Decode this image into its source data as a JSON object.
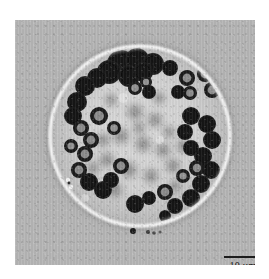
{
  "figure": {
    "kind": "light-micrograph",
    "caption_alt": "Spherical algal cell with dark chloroplast granules",
    "panel": {
      "background_color": "#b6b6b6",
      "interior_color": "#d2d2d2",
      "wall_highlight_color": "#fbfbfb",
      "granule_color": "#131313"
    }
  },
  "scalebar": {
    "label": "10 µm",
    "value": "10",
    "unit": "µm",
    "bar_color": "#1d1d1d",
    "bar_length_px": "38"
  },
  "specimen": {
    "center_x": 125,
    "center_y": 116,
    "radius": 91,
    "wall_thickness": 4,
    "sharp_granules": [
      {
        "cx": 106,
        "cy": 44,
        "r": 14,
        "type": "dark-mass"
      },
      {
        "cx": 122,
        "cy": 40,
        "r": 12,
        "type": "dark-mass"
      },
      {
        "cx": 138,
        "cy": 44,
        "r": 11,
        "type": "dark-mass"
      },
      {
        "cx": 94,
        "cy": 52,
        "r": 12,
        "type": "dark-mass"
      },
      {
        "cx": 114,
        "cy": 56,
        "r": 11,
        "type": "dark-mass"
      },
      {
        "cx": 155,
        "cy": 48,
        "r": 8,
        "type": "dark"
      },
      {
        "cx": 172,
        "cy": 58,
        "r": 8,
        "type": "ringed"
      },
      {
        "cx": 190,
        "cy": 54,
        "r": 8,
        "type": "ringed"
      },
      {
        "cx": 197,
        "cy": 70,
        "r": 8,
        "type": "ringed"
      },
      {
        "cx": 175,
        "cy": 73,
        "r": 7,
        "type": "ringed"
      },
      {
        "cx": 120,
        "cy": 68,
        "r": 7,
        "type": "ringed"
      },
      {
        "cx": 131,
        "cy": 62,
        "r": 6,
        "type": "ringed"
      },
      {
        "cx": 70,
        "cy": 66,
        "r": 10,
        "type": "dark"
      },
      {
        "cx": 62,
        "cy": 82,
        "r": 10,
        "type": "dark"
      },
      {
        "cx": 58,
        "cy": 96,
        "r": 9,
        "type": "dark"
      },
      {
        "cx": 66,
        "cy": 108,
        "r": 8,
        "type": "ringed"
      },
      {
        "cx": 76,
        "cy": 120,
        "r": 8,
        "type": "ringed"
      },
      {
        "cx": 70,
        "cy": 134,
        "r": 8,
        "type": "ringed"
      },
      {
        "cx": 64,
        "cy": 150,
        "r": 8,
        "type": "ringed"
      },
      {
        "cx": 74,
        "cy": 162,
        "r": 9,
        "type": "dark"
      },
      {
        "cx": 88,
        "cy": 170,
        "r": 9,
        "type": "dark"
      },
      {
        "cx": 84,
        "cy": 96,
        "r": 9,
        "type": "ringed"
      },
      {
        "cx": 99,
        "cy": 108,
        "r": 7,
        "type": "ringed"
      },
      {
        "cx": 106,
        "cy": 146,
        "r": 8,
        "type": "ringed"
      },
      {
        "cx": 120,
        "cy": 184,
        "r": 9,
        "type": "dark"
      },
      {
        "cx": 134,
        "cy": 178,
        "r": 7,
        "type": "dark"
      },
      {
        "cx": 150,
        "cy": 172,
        "r": 8,
        "type": "ringed"
      },
      {
        "cx": 160,
        "cy": 186,
        "r": 8,
        "type": "dark"
      },
      {
        "cx": 176,
        "cy": 178,
        "r": 9,
        "type": "dark"
      },
      {
        "cx": 186,
        "cy": 164,
        "r": 9,
        "type": "dark"
      },
      {
        "cx": 196,
        "cy": 150,
        "r": 9,
        "type": "dark"
      },
      {
        "cx": 188,
        "cy": 136,
        "r": 9,
        "type": "dark"
      },
      {
        "cx": 197,
        "cy": 120,
        "r": 9,
        "type": "dark"
      },
      {
        "cx": 192,
        "cy": 104,
        "r": 9,
        "type": "dark"
      },
      {
        "cx": 176,
        "cy": 96,
        "r": 9,
        "type": "dark"
      },
      {
        "cx": 170,
        "cy": 112,
        "r": 8,
        "type": "dark"
      },
      {
        "cx": 176,
        "cy": 128,
        "r": 8,
        "type": "dark"
      },
      {
        "cx": 182,
        "cy": 148,
        "r": 8,
        "type": "ringed"
      },
      {
        "cx": 168,
        "cy": 156,
        "r": 7,
        "type": "ringed"
      },
      {
        "cx": 134,
        "cy": 72,
        "r": 7,
        "type": "dark"
      },
      {
        "cx": 150,
        "cy": 196,
        "r": 6,
        "type": "dark"
      }
    ],
    "blurred_granules": [
      {
        "cx": 120,
        "cy": 92,
        "r": 12
      },
      {
        "cx": 140,
        "cy": 100,
        "r": 11
      },
      {
        "cx": 106,
        "cy": 116,
        "r": 12
      },
      {
        "cx": 128,
        "cy": 124,
        "r": 12
      },
      {
        "cx": 148,
        "cy": 130,
        "r": 11
      },
      {
        "cx": 92,
        "cy": 140,
        "r": 11
      },
      {
        "cx": 114,
        "cy": 150,
        "r": 12
      },
      {
        "cx": 136,
        "cy": 156,
        "r": 11
      },
      {
        "cx": 158,
        "cy": 146,
        "r": 11
      },
      {
        "cx": 168,
        "cy": 126,
        "r": 10
      },
      {
        "cx": 88,
        "cy": 120,
        "r": 10
      },
      {
        "cx": 100,
        "cy": 170,
        "r": 11
      },
      {
        "cx": 124,
        "cy": 108,
        "r": 9
      },
      {
        "cx": 154,
        "cy": 112,
        "r": 9
      },
      {
        "cx": 78,
        "cy": 148,
        "r": 9
      }
    ],
    "wall_debris": [
      {
        "cx": 53,
        "cy": 160,
        "r": 2
      },
      {
        "cx": 56,
        "cy": 166,
        "r": 2
      },
      {
        "cx": 118,
        "cy": 210,
        "r": 3
      },
      {
        "cx": 133,
        "cy": 212,
        "r": 2
      },
      {
        "cx": 140,
        "cy": 213,
        "r": 2
      }
    ]
  }
}
